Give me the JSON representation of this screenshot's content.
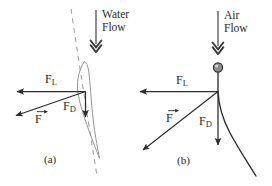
{
  "figure": {
    "caption_a": "(a)",
    "caption_b": "(b)",
    "background_color": "#ffffff",
    "ink_color": "#2b2b2b",
    "foil_outline_color": "#8a8a8a",
    "dashed_line_color": "#9a9a9a",
    "ball_fill_color": "#8d8d8d"
  },
  "panel_a": {
    "name": "hydrofoil-water-flow",
    "flow_label_line1": "Water",
    "flow_label_line2": "Flow",
    "lift_label": "F",
    "lift_sub": "L",
    "drag_label": "F",
    "drag_sub": "D",
    "resultant_label": "F",
    "caption": "(a)"
  },
  "panel_b": {
    "name": "ball-air-flow",
    "flow_label_line1": "Air",
    "flow_label_line2": "Flow",
    "lift_label": "F",
    "lift_sub": "L",
    "drag_label": "F",
    "drag_sub": "D",
    "resultant_label": "F",
    "caption": "(b)"
  }
}
